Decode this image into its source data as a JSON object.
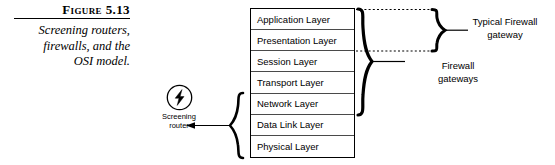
{
  "figure": {
    "number": "Figure 5.13",
    "caption_line1": "Screening routers,",
    "caption_line2": "firewalls, and the",
    "caption_line3": "OSI model."
  },
  "osi_stack": {
    "layers": [
      {
        "label": "Application Layer"
      },
      {
        "label": "Presentation Layer"
      },
      {
        "label": "Session Layer"
      },
      {
        "label": "Transport Layer"
      },
      {
        "label": "Network Layer"
      },
      {
        "label": "Data Link Layer"
      },
      {
        "label": "Physical Layer"
      }
    ]
  },
  "screening_router": {
    "icon": "lightning-bolt-circle-icon",
    "label_line1": "Screening",
    "label_line2": "router"
  },
  "annotations": {
    "firewall_gateways_line1": "Firewall",
    "firewall_gateways_line2": "gateways",
    "typical_firewall_line1": "Typical Firewall",
    "typical_firewall_line2": "gateway"
  },
  "colors": {
    "ink": "#000000",
    "rule": "#4a4a4a",
    "background": "#ffffff"
  }
}
